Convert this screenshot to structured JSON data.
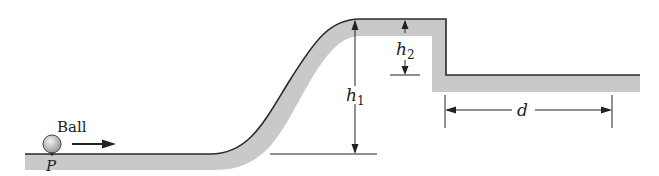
{
  "diagram": {
    "type": "physics-track",
    "labels": {
      "ball": "Ball",
      "point": "P",
      "h1_main": "h",
      "h1_sub": "1",
      "h2_main": "h",
      "h2_sub": "2",
      "distance": "d"
    },
    "colors": {
      "track_fill": "#c9c9c9",
      "line": "#2a2a2a",
      "ball_fill": "#d0d0d0"
    }
  }
}
